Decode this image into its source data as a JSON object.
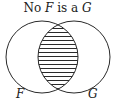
{
  "diagram": {
    "type": "venn",
    "title": {
      "prefix": "No ",
      "set_a": "F",
      "middle": " is a ",
      "set_b": "G"
    },
    "sets": [
      {
        "label": "F",
        "position": "left"
      },
      {
        "label": "G",
        "position": "right"
      }
    ],
    "shaded_region": "intersection",
    "shading_style": "horizontal-hatch",
    "colors": {
      "stroke": "#2a2a2a",
      "background": "#ffffff"
    }
  }
}
